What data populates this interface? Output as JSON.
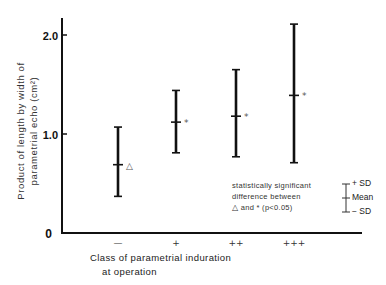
{
  "chart_data": {
    "type": "errorbar",
    "title": "",
    "xlabel": "Class of parametrial induration at operation",
    "xlabel_lines": [
      "Class of parametrial induration",
      "at operation"
    ],
    "ylabel": "Product of length by width of parametrial echo (cm²)",
    "ylabel_lines": [
      "Product of length by width of",
      "parametrial echo (cm²)"
    ],
    "ylim": [
      0,
      2.2
    ],
    "yticks": [
      0,
      1.0,
      2.0
    ],
    "ytick_labels": [
      "0",
      "1.0",
      "2.0"
    ],
    "grid": false,
    "categories": [
      "—",
      "+",
      "++",
      "+++"
    ],
    "series": [
      {
        "name": "Mean ± SD",
        "mean": [
          0.69,
          1.12,
          1.18,
          1.39
        ],
        "upper_sd": [
          1.07,
          1.44,
          1.65,
          2.11
        ],
        "lower_sd": [
          0.37,
          0.81,
          0.77,
          0.71
        ],
        "markers": [
          "△",
          "*",
          "*",
          "*"
        ]
      }
    ],
    "annotation": {
      "lines": [
        "statistically significant",
        "difference between",
        "△ and * (p<0.05)"
      ]
    },
    "legend": {
      "position": "lower right",
      "entries": [
        "+ SD",
        "Mean",
        "− SD"
      ]
    }
  }
}
